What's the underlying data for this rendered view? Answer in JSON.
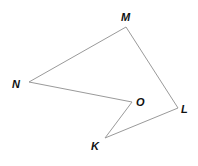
{
  "figure": {
    "type": "polygon",
    "name": "KLMNO",
    "stroke_color": "#9a9a9a",
    "label_color": "#111111",
    "vertices": [
      {
        "label": "M",
        "x": 126,
        "y": 27,
        "lx": 121,
        "ly": 21
      },
      {
        "label": "N",
        "x": 29,
        "y": 82,
        "lx": 12,
        "ly": 88
      },
      {
        "label": "O",
        "x": 132,
        "y": 102,
        "lx": 136,
        "ly": 106
      },
      {
        "label": "K",
        "x": 105,
        "y": 138,
        "lx": 91,
        "ly": 150
      },
      {
        "label": "L",
        "x": 178,
        "y": 108,
        "lx": 181,
        "ly": 113
      }
    ],
    "edges": [
      [
        "M",
        "N"
      ],
      [
        "N",
        "O"
      ],
      [
        "O",
        "K"
      ],
      [
        "K",
        "L"
      ],
      [
        "L",
        "M"
      ]
    ]
  }
}
